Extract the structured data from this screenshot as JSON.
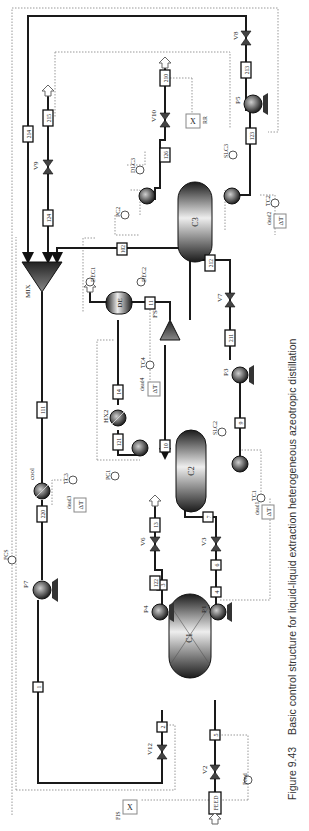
{
  "figure": {
    "number": "Figure 9.43",
    "caption": "Basic control structure for liquid-liquid extraction heterogeneous azeotropic distillation",
    "orientation": "rotated 90° counter-clockwise"
  },
  "units": {
    "columns": [
      {
        "id": "C1",
        "type": "extraction column"
      },
      {
        "id": "C2",
        "type": "distillation column"
      },
      {
        "id": "C3",
        "type": "distillation column"
      }
    ],
    "decanter": {
      "id": "DE"
    },
    "mixer": {
      "id": "MIX"
    },
    "splitter": {
      "id": "FS"
    },
    "pumps": [
      "P1",
      "P3",
      "P4",
      "P5",
      "P7"
    ],
    "valves": [
      "V2",
      "V3",
      "V6",
      "V7",
      "V8",
      "V9",
      "V10",
      "V12"
    ],
    "exchangers": [
      "HX2",
      "cool"
    ]
  },
  "streams": [
    "FEED",
    "5",
    "4",
    "3",
    "6",
    "124",
    "8",
    "13",
    "9",
    "10",
    "121",
    "14",
    "11",
    "211",
    "212",
    "102",
    "213",
    "210",
    "215",
    "124b",
    "214",
    "220",
    "111",
    "1",
    "2",
    "122",
    "123"
  ],
  "stream_labels": {
    "feed": "FEED",
    "s_feed_after_v2": "5",
    "s_c1_bottom_out": "4",
    "s_c1_top_out": "3",
    "s_p1_out": "6",
    "s_p4_out": "122",
    "s_to_c2": "7",
    "s_v6_out": "13",
    "s_c2_bottom_out": "9",
    "s_c2_reflux": "10",
    "s_hx2_in": "121",
    "s_hx2_out": "14",
    "s_de_out": "11",
    "s_p3_out": "211",
    "s_to_c3": "212",
    "s_fs_to_mix": "102",
    "s_c3_bottom_pump_in": "123",
    "s_p5_out": "213",
    "s_c3_dist": "126",
    "s_c3_dist_out": "210",
    "s_makeup": "215",
    "s_v9_out": "124",
    "s_recycle_214": "214",
    "s_cool_in": "111",
    "s_cool_out": "220",
    "s_p7_out": "1",
    "s_solvent_to_c1": "2"
  },
  "controllers": {
    "flow": [
      "Feed",
      "FCS",
      "FIS"
    ],
    "pressure": [
      "PC1",
      "PC2"
    ],
    "level": [
      "SLC2",
      "SLC3",
      "DEC1",
      "DEC2",
      "DLC3"
    ],
    "temperature": [
      "TC1",
      "TC2",
      "TC3",
      "TC4"
    ],
    "deadtime": [
      "dead1",
      "dead2",
      "dead3",
      "dead4"
    ],
    "ratio": [
      "RR",
      "FIS"
    ]
  },
  "symbols": {
    "delta_t": "ΔT",
    "multiply": "X"
  },
  "labels": {
    "C1": "C1",
    "C2": "C2",
    "C3": "C3",
    "DE": "DE",
    "MIX": "MIX",
    "FS": "FS",
    "P1": "P1",
    "P3": "P3",
    "P4": "P4",
    "P5": "P5",
    "P7": "P7",
    "V2": "V2",
    "V3": "V3",
    "V6": "V6",
    "V7": "V7",
    "V8": "V8",
    "V9": "V9",
    "V10": "V10",
    "V12": "V12",
    "HX2": "HX2",
    "cool": "cool",
    "Feed": "Feed",
    "FCS": "FCS",
    "FIS": "FIS",
    "RR": "RR",
    "PC1": "PC1",
    "PC2": "PC2",
    "SLC2": "SLC2",
    "SLC3": "SLC3",
    "DEC1": "DEC1",
    "DEC2": "DEC2",
    "DLC3": "DLC3",
    "TC1": "TC1",
    "TC2": "TC2",
    "TC3": "TC3",
    "TC4": "TC4",
    "dead1": "dead1",
    "dead2": "dead2",
    "dead3": "dead3",
    "dead4": "dead4",
    "dT": "ΔT",
    "X": "X",
    "t_FEED": "FEED",
    "t_5": "5",
    "t_4": "4",
    "t_3": "3",
    "t_6": "6",
    "t_122": "122",
    "t_7": "7",
    "t_13": "13",
    "t_9": "9",
    "t_10": "10",
    "t_121": "121",
    "t_14": "14",
    "t_11": "11",
    "t_211": "211",
    "t_212": "212",
    "t_102": "102",
    "t_123": "123",
    "t_213": "213",
    "t_126": "126",
    "t_210": "210",
    "t_215": "215",
    "t_124": "124",
    "t_214": "214",
    "t_111": "111",
    "t_220": "220",
    "t_1": "1",
    "t_2": "2"
  },
  "colors": {
    "pipe": "#1a1a1a",
    "signal": "#999999",
    "equipment_dark": "#2a2a2a",
    "equipment_light": "#e8e8e8",
    "background": "#ffffff"
  }
}
